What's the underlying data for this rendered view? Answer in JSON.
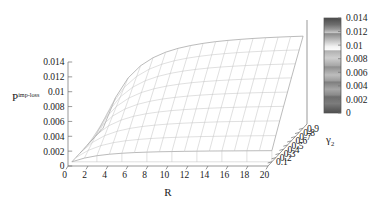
{
  "figure": {
    "type": "3d-surface-wireframe",
    "background_color": "#ffffff",
    "mesh_color": "#b9b9b9",
    "axis_color": "#6e6e6e",
    "text_color": "#1a1a1a"
  },
  "chart_data": {
    "type": "heatmap",
    "render_style": "3d surface mesh (gnuplot pm3d wireframe, hidden-line removal)",
    "title": "",
    "xlabel": "R",
    "ylabel": "γ2",
    "zlabel": "P^imp-loss",
    "xlim": [
      0,
      20
    ],
    "ylim": [
      0.0,
      1.0
    ],
    "zlim": [
      0,
      0.014
    ],
    "grid": true,
    "legend_position": "right-colorbar",
    "x_ticks": [
      0,
      2,
      4,
      6,
      8,
      10,
      12,
      14,
      16,
      18,
      20
    ],
    "x_tick_labels": [
      "0",
      "2",
      "4",
      "6",
      "8",
      "10",
      "12",
      "14",
      "16",
      "18",
      "20"
    ],
    "y_ticks": [
      0.1,
      0.2,
      0.3,
      0.4,
      0.5,
      0.6,
      0.7,
      0.8,
      0.9
    ],
    "y_tick_labels": [
      "0.1",
      "0.2",
      "0.3",
      "0.4",
      "0.5",
      "0.6",
      "0.7",
      "0.8",
      "0.9"
    ],
    "z_ticks": [
      0,
      0.002,
      0.004,
      0.006,
      0.008,
      0.01,
      0.012,
      0.014
    ],
    "z_tick_labels": [
      "0",
      "0.002",
      "0.004",
      "0.006",
      "0.008",
      "0.01",
      "0.012",
      "0.014"
    ],
    "x": [
      0,
      1.25,
      2.5,
      3.75,
      5,
      6.25,
      7.5,
      8.75,
      10,
      11.25,
      12.5,
      13.75,
      15,
      16.25,
      17.5,
      18.75,
      20
    ],
    "y": [
      0.1,
      0.2,
      0.3,
      0.4,
      0.5,
      0.6,
      0.7,
      0.8,
      0.9
    ],
    "series": [
      {
        "name": "γ2 = 0.1",
        "values": [
          0.0,
          0.0005,
          0.00082,
          0.00102,
          0.00115,
          0.00124,
          0.0013,
          0.00135,
          0.00138,
          0.00141,
          0.00143,
          0.00145,
          0.00146,
          0.00147,
          0.00148,
          0.00149,
          0.0015
        ]
      },
      {
        "name": "γ2 = 0.2",
        "values": [
          0.0,
          0.00098,
          0.00161,
          0.00201,
          0.00227,
          0.00244,
          0.00257,
          0.00266,
          0.00273,
          0.00278,
          0.00283,
          0.00286,
          0.00289,
          0.00291,
          0.00293,
          0.00295,
          0.00296
        ]
      },
      {
        "name": "γ2 = 0.3",
        "values": [
          0.0,
          0.00146,
          0.00239,
          0.00298,
          0.00336,
          0.00362,
          0.0038,
          0.00394,
          0.00404,
          0.00412,
          0.00418,
          0.00424,
          0.00428,
          0.00431,
          0.00434,
          0.00436,
          0.00438
        ]
      },
      {
        "name": "γ2 = 0.4",
        "values": [
          0.0,
          0.00192,
          0.00315,
          0.00392,
          0.00443,
          0.00477,
          0.00501,
          0.00519,
          0.00532,
          0.00543,
          0.00551,
          0.00558,
          0.00563,
          0.00568,
          0.00571,
          0.00574,
          0.00577
        ]
      },
      {
        "name": "γ2 = 0.5",
        "values": [
          0.0,
          0.00238,
          0.00389,
          0.00485,
          0.00547,
          0.00589,
          0.00619,
          0.00641,
          0.00658,
          0.00671,
          0.00681,
          0.00689,
          0.00696,
          0.00701,
          0.00706,
          0.00709,
          0.00712
        ]
      },
      {
        "name": "γ2 = 0.6",
        "values": [
          0.0,
          0.00283,
          0.00463,
          0.00576,
          0.0065,
          0.007,
          0.00736,
          0.00762,
          0.00782,
          0.00797,
          0.00809,
          0.00819,
          0.00827,
          0.00833,
          0.00839,
          0.00843,
          0.00847
        ]
      },
      {
        "name": "γ2 = 0.7",
        "values": [
          0.0,
          0.00327,
          0.00535,
          0.00666,
          0.00752,
          0.0081,
          0.00851,
          0.00881,
          0.00904,
          0.00922,
          0.00936,
          0.00947,
          0.00956,
          0.00964,
          0.0097,
          0.00975,
          0.0098
        ]
      },
      {
        "name": "γ2 = 0.8",
        "values": [
          0.0,
          0.00371,
          0.00606,
          0.00754,
          0.00851,
          0.00917,
          0.00964,
          0.00998,
          0.01024,
          0.01044,
          0.0106,
          0.01073,
          0.01083,
          0.01092,
          0.01099,
          0.01105,
          0.0111
        ]
      },
      {
        "name": "γ2 = 0.9",
        "values": [
          0.0,
          0.00414,
          0.00676,
          0.00841,
          0.00949,
          0.01023,
          0.01075,
          0.01113,
          0.01142,
          0.01165,
          0.01182,
          0.01196,
          0.01208,
          0.01218,
          0.01226,
          0.01233,
          0.01239
        ]
      }
    ]
  },
  "colorbar": {
    "min": 0,
    "max": 0.014,
    "tick_labels": [
      "0.014",
      "0.012",
      "0.01",
      "0.008",
      "0.006",
      "0.004",
      "0.002",
      "0"
    ],
    "tick_values": [
      0.014,
      0.012,
      0.01,
      0.008,
      0.006,
      0.004,
      0.002,
      0
    ],
    "orientation": "vertical",
    "palette": "grayscale-banded"
  },
  "labels": {
    "x_axis_title": "R",
    "y_axis_title_base": "γ",
    "y_axis_title_sub": "2",
    "z_axis_title_base": "P",
    "z_axis_title_sup": "imp-loss"
  }
}
